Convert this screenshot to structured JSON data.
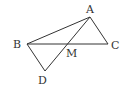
{
  "diagram": {
    "points": {
      "A": {
        "label": "A",
        "x": 90,
        "y": 17,
        "lx": 86,
        "ly": 13
      },
      "B": {
        "label": "B",
        "x": 27,
        "y": 44,
        "lx": 13,
        "ly": 48
      },
      "C": {
        "label": "C",
        "x": 108,
        "y": 44,
        "lx": 111,
        "ly": 49
      },
      "M": {
        "label": "M",
        "x": 68,
        "y": 44,
        "lx": 67,
        "ly": 57
      },
      "D": {
        "label": "D",
        "x": 45,
        "y": 71,
        "lx": 38,
        "ly": 83
      }
    },
    "segments": [
      [
        "A",
        "B"
      ],
      [
        "A",
        "C"
      ],
      [
        "B",
        "C"
      ],
      [
        "A",
        "D"
      ],
      [
        "B",
        "D"
      ]
    ],
    "stroke_color": "#333333"
  }
}
